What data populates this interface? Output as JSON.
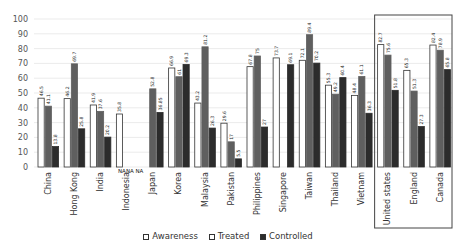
{
  "chart_data": {
    "type": "bar",
    "title": "",
    "xlabel": "",
    "ylabel": "",
    "ylim": [
      0,
      100
    ],
    "yticks": [
      0,
      10,
      20,
      30,
      40,
      50,
      60,
      70,
      80,
      90,
      100
    ],
    "grid": true,
    "legend_position": "bottom",
    "categories": [
      "China",
      "Hong Kong",
      "India",
      "Indonesia",
      "Japan",
      "Korea",
      "Malaysia",
      "Pakistan",
      "Philippines",
      "Singapore",
      "Taiwan",
      "Thailand",
      "Vietnam",
      "United states",
      "England",
      "Canada"
    ],
    "series": [
      {
        "name": "Awareness",
        "color": "#ffffff",
        "stroke": "#333333",
        "values": [
          46.5,
          46.2,
          41.9,
          35.8,
          null,
          66.9,
          43.2,
          29.6,
          67.8,
          73.7,
          72.1,
          55.3,
          48.4,
          82.7,
          65.3,
          82.4
        ]
      },
      {
        "name": "Treated",
        "color": "#5f5f5f",
        "stroke": "#5f5f5f",
        "values": [
          41.1,
          69.7,
          37.6,
          null,
          52.8,
          61,
          81.2,
          17,
          75,
          null,
          89.4,
          49.2,
          61.1,
          75.6,
          51.3,
          78.9
        ]
      },
      {
        "name": "Controlled",
        "color": "#2c2c2c",
        "stroke": "#2c2c2c",
        "values": [
          13.8,
          25.8,
          20.2,
          null,
          36.85,
          69.3,
          26.3,
          5.5,
          27,
          69.1,
          70.2,
          60.4,
          36.3,
          51.8,
          27.3,
          65.8
        ]
      }
    ],
    "na_label": "NA",
    "annotations": [
      "NANA NA"
    ],
    "highlight_box_categories": [
      "United states",
      "England",
      "Canada"
    ]
  },
  "legend": {
    "items": [
      {
        "label": "Awareness",
        "color": "#ffffff"
      },
      {
        "label": "Treated",
        "color": "#ffffff"
      },
      {
        "label": "Controlled",
        "color": "#2c2c2c"
      }
    ]
  }
}
